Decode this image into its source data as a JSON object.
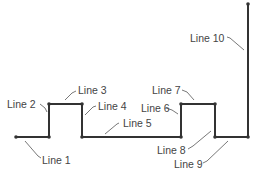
{
  "diagram": {
    "type": "polyline-segments",
    "stroke_color": "#333333",
    "label_color": "#444444",
    "vertices": [
      [
        16,
        137
      ],
      [
        49,
        137
      ],
      [
        49,
        104
      ],
      [
        82,
        104
      ],
      [
        82,
        137
      ],
      [
        181,
        137
      ],
      [
        181,
        104
      ],
      [
        215,
        104
      ],
      [
        215,
        137
      ],
      [
        248,
        137
      ],
      [
        248,
        4
      ]
    ],
    "lines": [
      {
        "id": 1,
        "label": "Line 1"
      },
      {
        "id": 2,
        "label": "Line 2"
      },
      {
        "id": 3,
        "label": "Line 3"
      },
      {
        "id": 4,
        "label": "Line 4"
      },
      {
        "id": 5,
        "label": "Line 5"
      },
      {
        "id": 6,
        "label": "Line 6"
      },
      {
        "id": 7,
        "label": "Line 7"
      },
      {
        "id": 8,
        "label": "Line 8"
      },
      {
        "id": 9,
        "label": "Line 9"
      },
      {
        "id": 10,
        "label": "Line 10"
      }
    ]
  }
}
